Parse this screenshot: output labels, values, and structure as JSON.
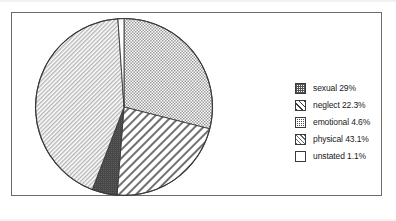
{
  "chart_data": {
    "type": "pie",
    "title": "",
    "subtitle": "",
    "xlabel": "",
    "ylabel": "",
    "legend_position": "right",
    "grid": false,
    "start_angle_deg": 0,
    "direction": "clockwise",
    "categories": [
      "sexual",
      "neglect",
      "emotional",
      "physical",
      "unstated"
    ],
    "values": [
      29,
      22.3,
      4.6,
      43.1,
      1.1
    ],
    "slices": [
      {
        "label": "sexual",
        "value": 29,
        "display": "29%",
        "legend_text": "sexual 29%",
        "pattern": "dots-medium"
      },
      {
        "label": "neglect",
        "value": 22.3,
        "display": "22.3%",
        "legend_text": "neglect 22.3%",
        "pattern": "diagonal-wide"
      },
      {
        "label": "emotional",
        "value": 4.6,
        "display": "4.6%",
        "legend_text": "emotional 4.6%",
        "pattern": "dots-dense-dark"
      },
      {
        "label": "physical",
        "value": 43.1,
        "display": "43.1%",
        "legend_text": "physical 43.1%",
        "pattern": "diagonal-fine"
      },
      {
        "label": "unstated",
        "value": 1.1,
        "display": "1.1%",
        "legend_text": "unstated 1.1%",
        "pattern": "plain-white"
      }
    ]
  },
  "legend": {
    "items": [
      {
        "label": "sexual 29%"
      },
      {
        "label": "neglect 22.3%"
      },
      {
        "label": "emotional 4.6%"
      },
      {
        "label": "physical 43.1%"
      },
      {
        "label": "unstated 1.1%"
      }
    ]
  },
  "colors": {
    "outline": "#3a3a3a",
    "frame": "#6b6b6b",
    "background": "#ffffff",
    "dark_slice": "#4a4a4a"
  }
}
